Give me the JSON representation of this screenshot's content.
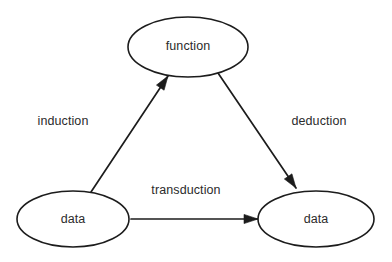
{
  "diagram": {
    "background_color": "#ffffff",
    "stroke_color": "#1c1c1c",
    "text_color": "#2b2b2b",
    "nodes": [
      {
        "id": "function",
        "label": "function",
        "shape": "ellipse",
        "cx": 188,
        "cy": 47,
        "rx": 60,
        "ry": 30
      },
      {
        "id": "data-left",
        "label": "data",
        "shape": "ellipse",
        "cx": 73,
        "cy": 219,
        "rx": 56,
        "ry": 28
      },
      {
        "id": "data-right",
        "label": "data",
        "shape": "ellipse",
        "cx": 316,
        "cy": 219,
        "rx": 58,
        "ry": 28
      }
    ],
    "edges": [
      {
        "id": "induction",
        "label": "induction",
        "from": "data-left",
        "to": "function",
        "x1": 91,
        "y1": 192,
        "x2": 168,
        "y2": 76,
        "label_x": 63,
        "label_y": 122,
        "arrowhead": "end"
      },
      {
        "id": "deduction",
        "label": "deduction",
        "from": "function",
        "to": "data-right",
        "x1": 218,
        "y1": 73,
        "x2": 296,
        "y2": 188,
        "label_x": 319,
        "label_y": 122,
        "arrowhead": "end"
      },
      {
        "id": "transduction",
        "label": "transduction",
        "from": "data-left",
        "to": "data-right",
        "x1": 131,
        "y1": 219,
        "x2": 258,
        "y2": 219,
        "label_x": 186,
        "label_y": 191,
        "arrowhead": "end"
      }
    ]
  }
}
